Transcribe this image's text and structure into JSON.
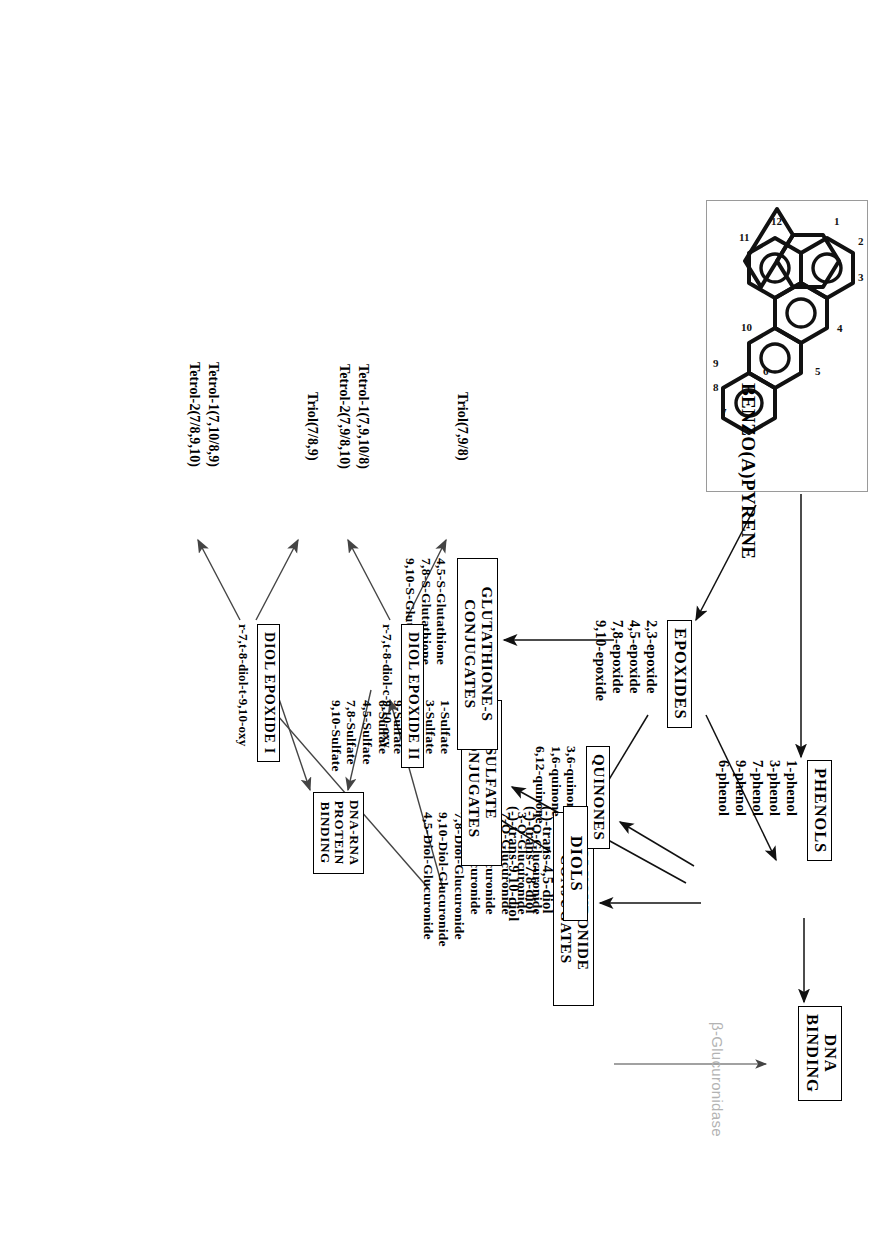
{
  "figure": {
    "orientation_note": "page rotated 90 degrees"
  },
  "structure": {
    "caption": "BENZO(A)PYRENE",
    "ring_labels": [
      "1",
      "2",
      "3",
      "4",
      "5",
      "6",
      "7",
      "8",
      "9",
      "10",
      "11",
      "12"
    ]
  },
  "nodes": {
    "dna_binding": {
      "title": "DNA\nBINDING"
    },
    "phenols": {
      "title": "PHENOLS",
      "items": "1-phenol\n3-phenol\n7-phenol\n9-phenol\n6-phenol"
    },
    "glucuronide": {
      "title": "GLUCURONIDE\nCONJUGATES",
      "items": "1-O-Glucuronide\n3-O-Glucuronide\n7-O-Glucuronide\n9-O-Glucuronide\n6-O-Glucuronide\n7,8-Diol-Glucuronide\n9,10-Diol-Glucuronide\n4,5-Diol-Glucuronide"
    },
    "quinones": {
      "title": "QUINONES",
      "items": "3,6-quinone\n1,6-quinone\n6,12-quinone"
    },
    "sulfate": {
      "title": "SULFATE\nCONJUGATES",
      "items": "1-Sulfate\n3-Sulfate\n7-Sulfate\n9-Sulfate\n6-Sulfate\n4,5-Sulfate\n7,8-Sulfate\n9,10-Sulfate"
    },
    "epoxides": {
      "title": "EPOXIDES",
      "items": "2,3-epoxide\n4,5-epoxide\n7,8-epoxide\n9,10-epoxide"
    },
    "glutathione": {
      "title": "GLUTATHIONE-S\nCONJUGATES",
      "items": "4,5-S-Glutathione\n7,8-S-Glutathione\n9,10-S-Glutathione"
    },
    "diols": {
      "title": "DIOLS",
      "items": "(-)-trans-4,5-diol\n(-)-trans-7,8-diol\n(-)-trans-9,10-diol"
    },
    "dna_rna_protein": {
      "title": "DNA-RNA\nPROTEIN\nBINDING"
    },
    "diol_epoxide_1": {
      "title": "DIOL EPOXIDE I",
      "formula": "r-7,t-8-diol-t-9,10-oxy",
      "products_left": "Tetrol-1(7,10/8,9)\nTetrol-2(7/8,9,10)",
      "products_right": "Triol(7/8,9)"
    },
    "diol_epoxide_2": {
      "title": "DIOL EPOXIDE II",
      "formula": "r-7,t-8-diol-c-9,10-oxy",
      "products_left": "Tetrol-1(7,9,10/8)\nTetrol-2(7,9/8,10)",
      "products_right": "Triol(7,9/8)"
    }
  },
  "edge_labels": {
    "beta_glucuronidase": "β-Glucuronidase"
  },
  "colors": {
    "ink": "#000000",
    "faint_label": "#b3b3b3",
    "panel_border": "#9a9a9a"
  }
}
